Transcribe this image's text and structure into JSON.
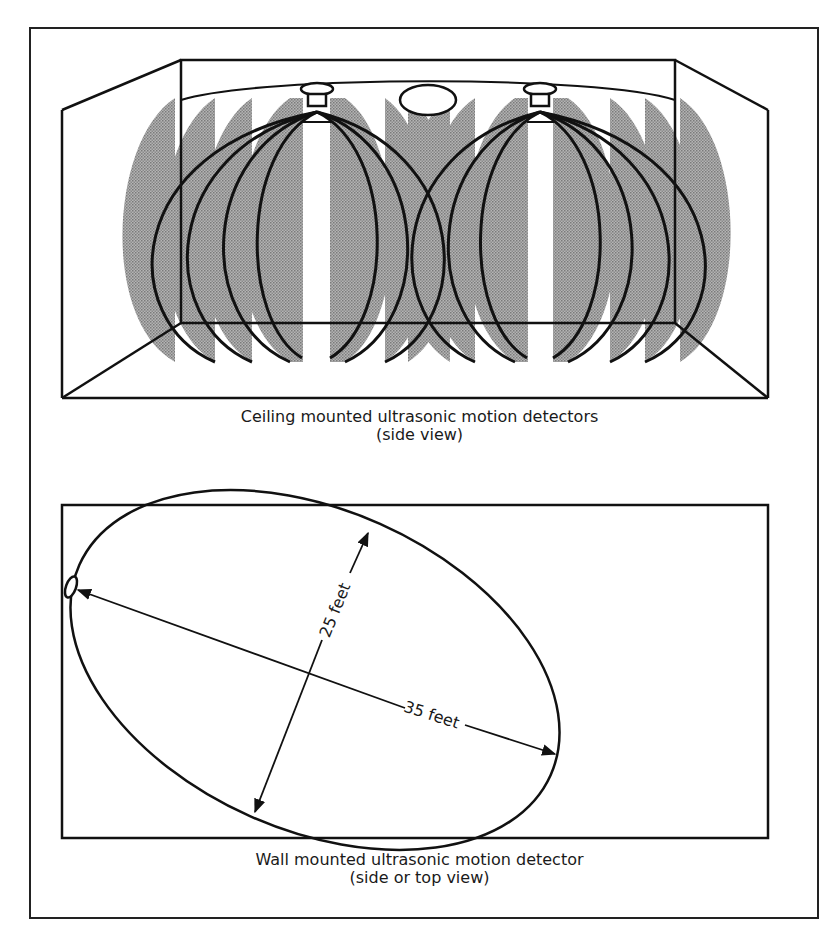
{
  "figure": {
    "colors": {
      "line": "#111111",
      "lobe_fill": "#9a9a9a",
      "background": "#ffffff"
    },
    "panels": [
      {
        "id": "ceiling",
        "caption_line1": "Ceiling mounted ultrasonic motion detectors",
        "caption_line2": "(side view)",
        "detector_count": 2,
        "lobes_per_detector": 7
      },
      {
        "id": "wall",
        "caption_line1": "Wall mounted ultrasonic motion detector",
        "caption_line2": "(side or top view)",
        "dimensions": {
          "width_label": "25 feet",
          "length_label": "35 feet"
        }
      }
    ]
  }
}
